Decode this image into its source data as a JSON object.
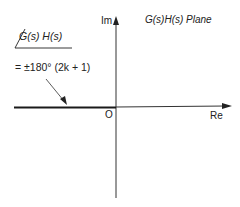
{
  "diagram": {
    "title": "G(s)H(s)  Plane",
    "axes": {
      "imaginary_label": "Im",
      "real_label": "Re",
      "origin_label": "O"
    },
    "annotation": {
      "angle_expression": "G(s)  H(s)",
      "equation": "= ±180° (2k + 1)"
    },
    "colors": {
      "line": "#2a2a2a",
      "thick_segment": "#1a1a1a",
      "background": "#ffffff"
    }
  }
}
